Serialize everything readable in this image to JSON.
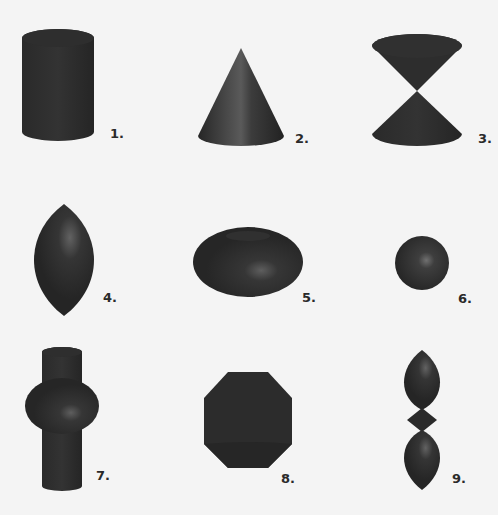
{
  "figure": {
    "background": "#f4f4f4",
    "shape_color": "#2b2b2b",
    "highlight_color": "#6a6a6a",
    "items": [
      {
        "label": "1.",
        "shape": "cylinder"
      },
      {
        "label": "2.",
        "shape": "cone"
      },
      {
        "label": "3.",
        "shape": "double-cone"
      },
      {
        "label": "4.",
        "shape": "lemon-spindle"
      },
      {
        "label": "5.",
        "shape": "torus"
      },
      {
        "label": "6.",
        "shape": "sphere"
      },
      {
        "label": "7.",
        "shape": "cylinder-with-torus"
      },
      {
        "label": "8.",
        "shape": "octagonal-solid"
      },
      {
        "label": "9.",
        "shape": "stacked-spindles"
      }
    ]
  }
}
